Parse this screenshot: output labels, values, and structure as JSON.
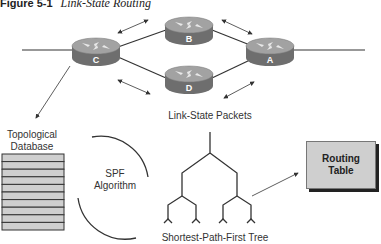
{
  "figure": {
    "number": "Figure 5-1",
    "title": "Link-State Routing"
  },
  "routers": [
    {
      "id": "C",
      "label": "C"
    },
    {
      "id": "B",
      "label": "B"
    },
    {
      "id": "D",
      "label": "D"
    },
    {
      "id": "A",
      "label": "A"
    }
  ],
  "labels": {
    "link_state_packets": "Link-State Packets",
    "topological_database_line1": "Topological",
    "topological_database_line2": "Database",
    "spf_line1": "SPF",
    "spf_line2": "Algorithm",
    "routing_table_line1": "Routing",
    "routing_table_line2": "Table",
    "spf_tree": "Shortest-Path-First Tree"
  },
  "database": {
    "rows": 10
  },
  "colors": {
    "router_top": "#9a9a9a",
    "router_side": "#6e6e6e",
    "line": "#333333",
    "db_fill": "#cfcfcf",
    "routing_table_fill": "#cfcfcf"
  }
}
